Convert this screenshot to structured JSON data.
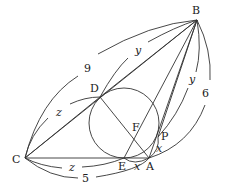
{
  "diagram": {
    "points": {
      "A": {
        "label": "A",
        "x": 149,
        "y": 158
      },
      "B": {
        "label": "B",
        "x": 197,
        "y": 20
      },
      "C": {
        "label": "C",
        "x": 25,
        "y": 158
      },
      "D": {
        "label": "D",
        "x": 100,
        "y": 97
      },
      "E": {
        "label": "E",
        "x": 124,
        "y": 158
      },
      "F": {
        "label": "F",
        "x": 136,
        "y": 126
      },
      "P": {
        "label": "P",
        "x": 158,
        "y": 137
      }
    },
    "circle": {
      "cx": 124,
      "cy": 123,
      "r": 35
    },
    "measures": {
      "BC": "9",
      "AB": "6",
      "CA": "5",
      "BD": "y",
      "BP": "y",
      "CD": "z",
      "CE": "z",
      "EA": "x",
      "AP": "x"
    },
    "colors": {
      "stroke": "#333333",
      "text": "#222222",
      "background": "#ffffff"
    }
  }
}
